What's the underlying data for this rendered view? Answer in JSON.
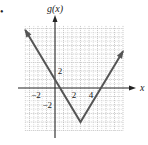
{
  "bullet": "•",
  "chart_data": {
    "type": "line",
    "title": "",
    "function_label": "g(x)",
    "xlabel": "x",
    "ylabel": "g(x)",
    "series": [
      {
        "name": "g(x)",
        "points": [
          [
            -3.5,
            6.83
          ],
          [
            3,
            -4
          ],
          [
            8,
            4.33
          ]
        ],
        "description": "V-shaped absolute value graph, vertex (3, -4), slopes -5/3 and 5/3, arrows on both ends"
      }
    ],
    "vertex": [
      3,
      -4
    ],
    "y_intercept": 1,
    "x_intercepts": [
      0.6,
      5.4
    ],
    "x_tick_labels": [
      "-2",
      "2",
      "4"
    ],
    "y_tick_labels": [
      "2",
      "-2"
    ],
    "x_ticks": [
      -2,
      2,
      4
    ],
    "y_ticks": [
      2,
      -2
    ],
    "xlim": [
      -3.5,
      8
    ],
    "ylim": [
      -5,
      7.3
    ],
    "grid": true,
    "grid_style": "dotted",
    "legend": "none",
    "colors": {
      "line": "#555555",
      "axes": "#222222",
      "grid": "#b0b0b0"
    }
  }
}
